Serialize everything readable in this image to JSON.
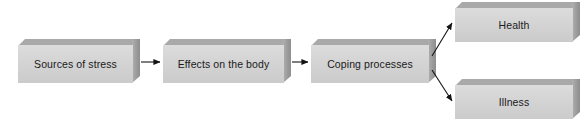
{
  "diagram": {
    "style": {
      "box_face_color": "#d4d4d4",
      "box_top_color": "#a9a9a9",
      "box_side_color": "#9a9a9a",
      "text_color": "#1a1a1a",
      "arrow_color": "#1a1a1a",
      "background_color": "#ffffff"
    },
    "nodes": [
      {
        "id": "sources-of-stress",
        "label": "Sources of stress",
        "x": 18,
        "y": 39,
        "width": 122,
        "height": 44
      },
      {
        "id": "effects-on-the-body",
        "label": "Effects on the body",
        "x": 163,
        "y": 39,
        "width": 128,
        "height": 44
      },
      {
        "id": "coping-processes",
        "label": "Coping processes",
        "x": 311,
        "y": 39,
        "width": 125,
        "height": 44
      },
      {
        "id": "health",
        "label": "Health",
        "x": 455,
        "y": 2,
        "width": 125,
        "height": 40
      },
      {
        "id": "illness",
        "label": "Illness",
        "x": 455,
        "y": 79,
        "width": 125,
        "height": 40
      }
    ],
    "edges": [
      {
        "id": "edge-sources-to-effects",
        "from": "sources-of-stress",
        "to": "effects-on-the-body",
        "kind": "straight-arrow"
      },
      {
        "id": "edge-effects-to-coping",
        "from": "effects-on-the-body",
        "to": "coping-processes",
        "kind": "straight-arrow"
      },
      {
        "id": "edge-coping-to-health",
        "from": "coping-processes",
        "to": "health",
        "kind": "diagonal-arrow-up"
      },
      {
        "id": "edge-coping-to-illness",
        "from": "coping-processes",
        "to": "illness",
        "kind": "diagonal-arrow-down"
      }
    ]
  }
}
